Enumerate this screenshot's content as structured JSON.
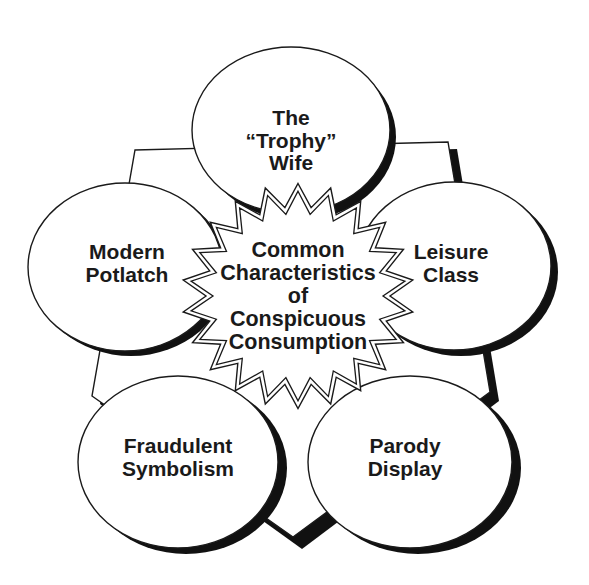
{
  "diagram": {
    "type": "radial-concept-diagram",
    "center": {
      "lines": [
        "Common",
        "Characteristics",
        "of",
        "Conspicuous",
        "Consumption"
      ],
      "shape": "starburst-double-outline"
    },
    "nodes": [
      {
        "id": "top",
        "lines": [
          "The",
          "“Trophy”",
          "Wife"
        ]
      },
      {
        "id": "right",
        "lines": [
          "Leisure",
          "Class"
        ]
      },
      {
        "id": "bottom-right",
        "lines": [
          "Parody",
          "Display"
        ]
      },
      {
        "id": "bottom-left",
        "lines": [
          "Fraudulent",
          "Symbolism"
        ]
      },
      {
        "id": "left",
        "lines": [
          "Modern",
          "Potlatch"
        ]
      }
    ],
    "colors": {
      "background": "#ffffff",
      "stroke": "#1a1a1a",
      "fill": "#ffffff",
      "shadow": "#111111"
    }
  }
}
